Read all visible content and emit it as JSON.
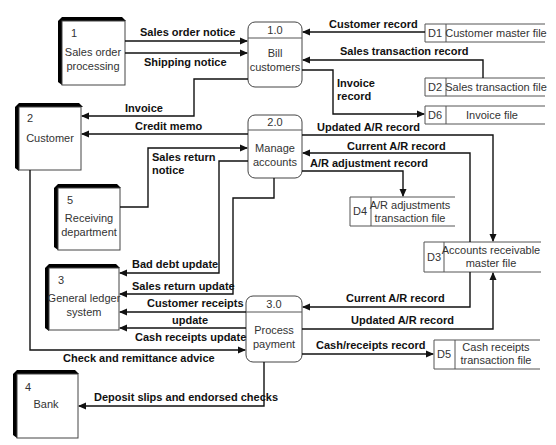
{
  "diagram": {
    "type": "data-flow-diagram",
    "entities": [
      {
        "id": "1",
        "label_l1": "Sales order",
        "label_l2": "processing"
      },
      {
        "id": "2",
        "label_l1": "Customer",
        "label_l2": ""
      },
      {
        "id": "3",
        "label_l1": "General ledger",
        "label_l2": "system"
      },
      {
        "id": "4",
        "label_l1": "Bank",
        "label_l2": ""
      },
      {
        "id": "5",
        "label_l1": "Receiving",
        "label_l2": "department"
      }
    ],
    "processes": [
      {
        "id": "1.0",
        "label_l1": "Bill",
        "label_l2": "customers"
      },
      {
        "id": "2.0",
        "label_l1": "Manage",
        "label_l2": "accounts"
      },
      {
        "id": "3.0",
        "label_l1": "Process",
        "label_l2": "payment"
      }
    ],
    "stores": [
      {
        "id": "D1",
        "label_l1": "Customer master file",
        "label_l2": ""
      },
      {
        "id": "D2",
        "label_l1": "Sales transaction file",
        "label_l2": ""
      },
      {
        "id": "D6",
        "label_l1": "Invoice file",
        "label_l2": ""
      },
      {
        "id": "D4",
        "label_l1": "A/R adjustments",
        "label_l2": "transaction file"
      },
      {
        "id": "D3",
        "label_l1": "Accounts receivable",
        "label_l2": "master file"
      },
      {
        "id": "D5",
        "label_l1": "Cash receipts",
        "label_l2": "transaction file"
      }
    ],
    "flows": {
      "sales_order_notice": "Sales order notice",
      "shipping_notice": "Shipping notice",
      "customer_record": "Customer record",
      "sales_transaction_record": "Sales transaction record",
      "invoice_record_l1": "Invoice",
      "invoice_record_l2": "record",
      "invoice": "Invoice",
      "credit_memo": "Credit memo",
      "updated_ar_record_1": "Updated A/R record",
      "current_ar_record_1": "Current A/R record",
      "ar_adjustment_record": "A/R adjustment record",
      "sales_return_notice_l1": "Sales return",
      "sales_return_notice_l2": "notice",
      "bad_debt_update": "Bad debt update",
      "sales_return_update": "Sales return update",
      "customer_receipts_update_l1": "Customer receipts",
      "customer_receipts_update_l2": "update",
      "cash_receipts_update": "Cash receipts update",
      "current_ar_record_2": "Current A/R record",
      "updated_ar_record_2": "Updated A/R record",
      "cash_receipts_record": "Cash/receipts record",
      "check_and_remittance_advice": "Check and remittance advice",
      "deposit_slips": "Deposit slips and endorsed checks"
    }
  }
}
